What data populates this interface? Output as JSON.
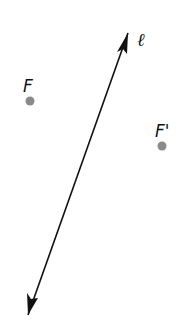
{
  "diagram": {
    "line": {
      "label": "ℓ",
      "start": [
        28,
        315
      ],
      "end": [
        128,
        33
      ],
      "color": "#111111",
      "arrows": "both"
    },
    "points": [
      {
        "label": "F",
        "x": 30,
        "y": 101,
        "label_x": 23,
        "label_y": 92,
        "color": "#8a8a8a"
      },
      {
        "label": "F'",
        "x": 162,
        "y": 146,
        "label_x": 155,
        "label_y": 137,
        "color": "#8a8a8a"
      }
    ],
    "line_label_pos": [
      137,
      46
    ]
  }
}
